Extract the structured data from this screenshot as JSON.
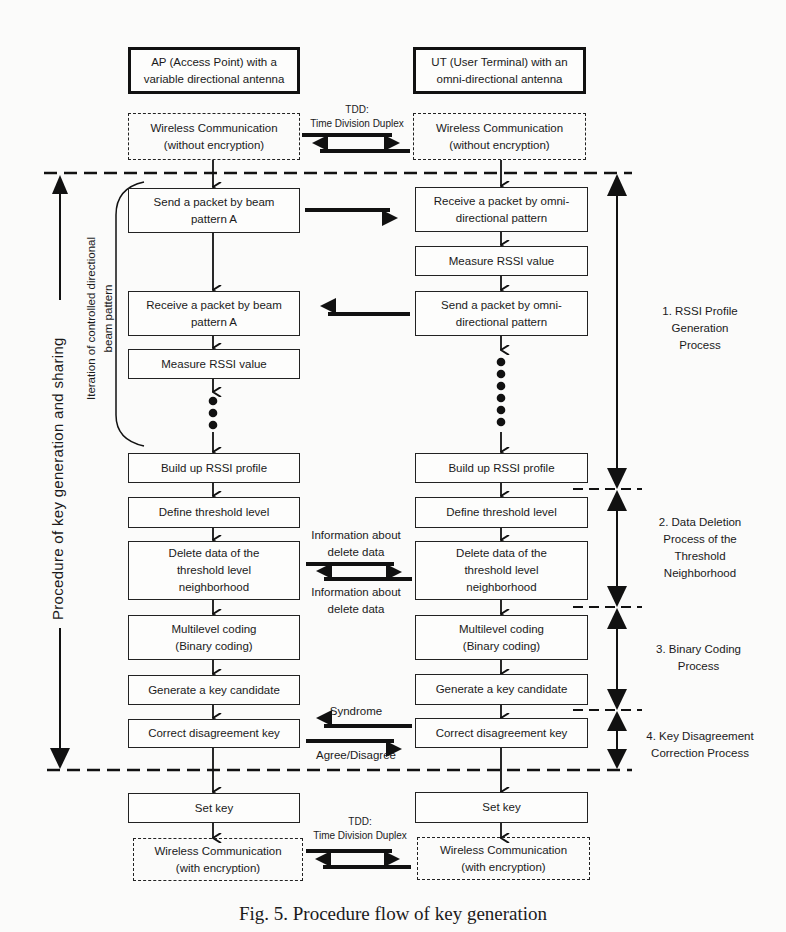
{
  "diagram": {
    "columns": {
      "ap": {
        "header": "AP (Access Point) with  a\nvariable directional antenna",
        "comm_top": "Wireless Communication\n(without encryption)",
        "steps": [
          "Send a packet by beam\npattern A",
          "Receive a packet by beam\npattern A",
          "Measure RSSI value",
          "Build up RSSI profile",
          "Define threshold level",
          "Delete data of the\nthreshold level\nneighborhood",
          "Multilevel coding\n(Binary coding)",
          "Generate a key candidate",
          "Correct disagreement key",
          "Set key"
        ],
        "comm_bottom": "Wireless Communication\n(with encryption)"
      },
      "ut": {
        "header": "UT (User Terminal) with an\nomni-directional antenna",
        "comm_top": "Wireless Communication\n(without encryption)",
        "steps": [
          "Receive a packet by omni-\ndirectional pattern",
          "Measure RSSI value",
          "Send a packet by omni-\ndirectional pattern",
          "Build up RSSI profile",
          "Define threshold level",
          "Delete data of the\nthreshold level\nneighborhood",
          "Multilevel coding\n(Binary coding)",
          "Generate a key candidate",
          "Correct disagreement key",
          "Set key"
        ],
        "comm_bottom": "Wireless Communication\n(with encryption)"
      }
    },
    "exchange_labels": {
      "tdd_top": "TDD:\nTime Division Duplex",
      "info_delete_forward": "Information about\ndelete data",
      "info_delete_back": "Information about\ndelete data",
      "syndrome": "Syndrome",
      "agree": "Agree/Disagree",
      "tdd_bottom": "TDD:\nTime Division Duplex"
    },
    "side_labels": {
      "procedure": "Procedure of key generation and sharing",
      "iteration": "Iteration of controlled directional\nbeam pattern"
    },
    "phases": [
      {
        "label": "1. RSSI Profile\nGeneration\nProcess"
      },
      {
        "label": "2. Data Deletion\nProcess of the\nThreshold\nNeighborhood"
      },
      {
        "label": "3. Binary Coding\nProcess"
      },
      {
        "label": "4. Key Disagreement\nCorrection Process"
      }
    ],
    "caption": "Fig. 5. Procedure flow of key generation"
  }
}
